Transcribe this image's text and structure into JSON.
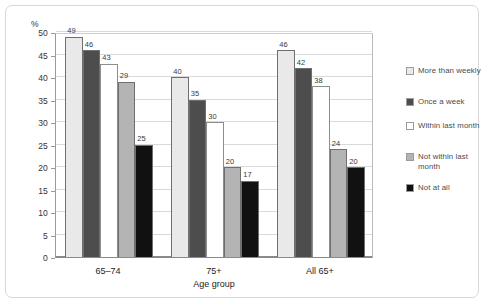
{
  "chart_data": {
    "type": "bar",
    "title": "",
    "subtitle": "",
    "xlabel": "Age group",
    "ylabel": "%",
    "ylim": [
      0,
      50
    ],
    "ytick_step": 5,
    "yticks": [
      "0",
      "5",
      "10",
      "15",
      "20",
      "25",
      "30",
      "35",
      "40",
      "45",
      "50"
    ],
    "grid": true,
    "legend_position": "right",
    "categories": [
      "65–74",
      "75+",
      "All 65+"
    ],
    "series": [
      {
        "name": "More than weekly",
        "color": "#e9e9e9",
        "values": [
          49,
          40,
          46
        ],
        "labels": [
          "49",
          "40",
          "46"
        ]
      },
      {
        "name": "Once a week",
        "color": "#4d4d4d",
        "values": [
          46,
          35,
          42
        ],
        "labels": [
          "46",
          "35",
          "42"
        ]
      },
      {
        "name": "Within last month",
        "color": "#ffffff",
        "values": [
          43,
          30,
          38
        ],
        "labels": [
          "43",
          "30",
          "38"
        ]
      },
      {
        "name": "Not within last month",
        "color": "#b4b4b4",
        "values": [
          39,
          20,
          24
        ],
        "labels": [
          "29",
          "20",
          "24"
        ]
      },
      {
        "name": "Not at all",
        "color": "#111111",
        "values": [
          25,
          17,
          20
        ],
        "labels": [
          "25",
          "17",
          "20"
        ]
      }
    ]
  },
  "legend": {
    "items": [
      {
        "label": "More than weekly",
        "color": "#e9e9e9"
      },
      {
        "label": "Once a week",
        "color": "#4d4d4d"
      },
      {
        "label": "Within last month",
        "color": "#ffffff"
      },
      {
        "label": "Not within last month",
        "color": "#b4b4b4"
      },
      {
        "label": "Not at all",
        "color": "#111111"
      }
    ]
  },
  "axis": {
    "y_unit_label": "%",
    "x_title": "Age group"
  }
}
